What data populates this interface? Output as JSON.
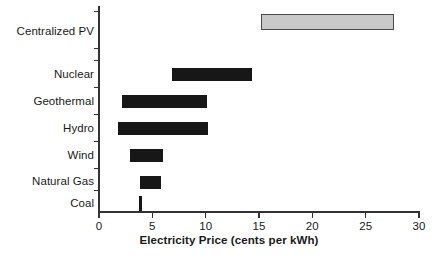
{
  "chart_data": {
    "type": "bar",
    "orientation": "horizontal",
    "subtype": "range-bar",
    "title": "",
    "xlabel": "Electricity Price (cents per kWh)",
    "ylabel": "",
    "xlim": [
      0,
      30
    ],
    "xticks": [
      0,
      5,
      10,
      15,
      20,
      25,
      30
    ],
    "xtick_labels": [
      "0",
      "5",
      "10",
      "15",
      "20",
      "25",
      "30"
    ],
    "grid": false,
    "legend": false,
    "categories": [
      "Centralized PV",
      "Nuclear",
      "Geothermal",
      "Hydro",
      "Wind",
      "Natural Gas",
      "Coal"
    ],
    "bars": [
      {
        "category": "Centralized PV",
        "low": 15.2,
        "high": 27.7,
        "style": "shaded",
        "fill": "#c9c9c9",
        "edge": "#4a4a4a"
      },
      {
        "category": "Nuclear",
        "low": 6.8,
        "high": 14.3,
        "style": "solid",
        "fill": "#171717",
        "edge": "#171717"
      },
      {
        "category": "Geothermal",
        "low": 2.2,
        "high": 10.1,
        "style": "solid",
        "fill": "#171717",
        "edge": "#171717"
      },
      {
        "category": "Hydro",
        "low": 1.8,
        "high": 10.2,
        "style": "solid",
        "fill": "#171717",
        "edge": "#171717"
      },
      {
        "category": "Wind",
        "low": 2.9,
        "high": 6.0,
        "style": "solid",
        "fill": "#171717",
        "edge": "#171717"
      },
      {
        "category": "Natural Gas",
        "low": 3.8,
        "high": 5.8,
        "style": "solid",
        "fill": "#171717",
        "edge": "#171717"
      },
      {
        "category": "Coal",
        "low": 3.9,
        "high": 3.9,
        "style": "point",
        "fill": "#171717",
        "edge": "#171717"
      }
    ],
    "axis_color": "#333333",
    "background": "#ffffff"
  },
  "labels": {
    "centralized_pv": "Centralized PV",
    "nuclear": "Nuclear",
    "geothermal": "Geothermal",
    "hydro": "Hydro",
    "wind": "Wind",
    "natural_gas": "Natural Gas",
    "coal": "Coal",
    "x_axis_title": "Electricity Price (cents per kWh)"
  },
  "xtick_labels": {
    "t0": "0",
    "t1": "5",
    "t2": "10",
    "t3": "15",
    "t4": "20",
    "t5": "25",
    "t6": "30"
  }
}
